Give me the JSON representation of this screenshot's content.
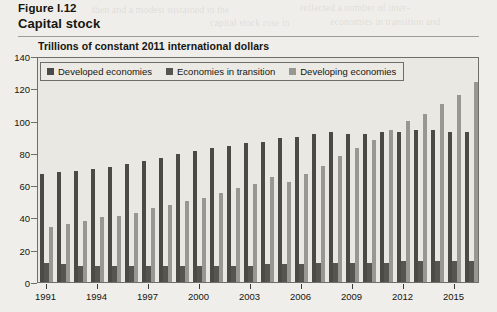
{
  "figure": {
    "caption": "Figure I.12",
    "title": "Capital stock",
    "subtitle": "Trillions of constant 2011 international dollars"
  },
  "legend": {
    "items": [
      {
        "label": "Developed economies",
        "color": "#4b4a47",
        "key": "developed"
      },
      {
        "label": "Economies in transition",
        "color": "#565550",
        "key": "transition"
      },
      {
        "label": "Developing economies",
        "color": "#989792",
        "key": "developing"
      }
    ]
  },
  "chart_data": {
    "type": "bar",
    "title": "Capital stock",
    "subtitle": "Trillions of constant 2011 international dollars",
    "xlabel": "",
    "ylabel": "Trillions of constant 2011 international dollars",
    "ylim": [
      0,
      140
    ],
    "yticks": [
      0,
      20,
      40,
      60,
      80,
      100,
      120,
      140
    ],
    "grid": false,
    "legend_position": "top-left",
    "categories": [
      "1991",
      "1992",
      "1993",
      "1994",
      "1995",
      "1996",
      "1997",
      "1998",
      "1999",
      "2000",
      "2001",
      "2002",
      "2003",
      "2004",
      "2005",
      "2006",
      "2007",
      "2008",
      "2009",
      "2010",
      "2011",
      "2012",
      "2013",
      "2014",
      "2015",
      "2016"
    ],
    "xtick_labels": [
      "1991",
      "1994",
      "1997",
      "2000",
      "2003",
      "2006",
      "2009",
      "2012",
      "2015"
    ],
    "series": [
      {
        "name": "Developed economies",
        "color": "#4b4a47",
        "values": [
          67,
          68,
          69,
          70,
          71,
          73,
          75,
          77,
          79,
          81,
          83,
          84,
          86,
          87,
          89,
          90,
          92,
          93,
          92,
          92,
          93,
          93,
          94,
          94,
          93,
          93
        ]
      },
      {
        "name": "Economies in transition",
        "color": "#565550",
        "values": [
          12,
          11,
          10,
          10,
          10,
          10,
          10,
          10,
          10,
          10,
          10,
          10,
          10,
          11,
          11,
          11,
          12,
          12,
          12,
          12,
          12,
          13,
          13,
          13,
          13,
          13
        ]
      },
      {
        "name": "Developing economies",
        "color": "#989792",
        "values": [
          34,
          36,
          38,
          40,
          41,
          43,
          46,
          48,
          50,
          52,
          55,
          58,
          61,
          65,
          62,
          67,
          72,
          78,
          83,
          88,
          94,
          100,
          104,
          110,
          116,
          124
        ]
      }
    ]
  },
  "bleed_text": [
    {
      "text": "then and a modest sustained in the",
      "x": 92,
      "y": 4,
      "size": 10
    },
    {
      "text": "reflected a number of inter-",
      "x": 300,
      "y": 2,
      "size": 10
    },
    {
      "text": "capital stock rose in",
      "x": 210,
      "y": 17,
      "size": 10
    },
    {
      "text": "economies in transition and",
      "x": 330,
      "y": 16,
      "size": 10
    },
    {
      "text": "growth of output per worker",
      "x": 170,
      "y": 86,
      "size": 10
    },
    {
      "text": "the capital stock, while",
      "x": 200,
      "y": 98,
      "size": 10
    },
    {
      "text": "is illustrated in Figure I.12,",
      "x": 150,
      "y": 108,
      "size": 10
    },
    {
      "text": "growth in the developing",
      "x": 180,
      "y": 120,
      "size": 10
    },
    {
      "text": "rate of capital accumulation",
      "x": 150,
      "y": 132,
      "size": 10
    },
    {
      "text": "the stock of capital",
      "x": 160,
      "y": 144,
      "size": 10
    },
    {
      "text": "to the level in the",
      "x": 120,
      "y": 156,
      "size": 10
    },
    {
      "text": "1990s",
      "x": 100,
      "y": 168,
      "size": 10
    },
    {
      "text": "and the",
      "x": 395,
      "y": 96,
      "size": 10
    },
    {
      "text": "the limits the",
      "x": 360,
      "y": 110,
      "size": 10
    },
    {
      "text": "to such",
      "x": 395,
      "y": 122,
      "size": 10
    },
    {
      "text": "1991",
      "x": 70,
      "y": 226,
      "size": 10
    },
    {
      "text": "1997",
      "x": 180,
      "y": 240,
      "size": 10
    },
    {
      "text": "2003",
      "x": 290,
      "y": 250,
      "size": 10
    },
    {
      "text": "in order to raise",
      "x": 320,
      "y": 84,
      "size": 10
    },
    {
      "text": "that have been drawn",
      "x": 300,
      "y": 96,
      "size": 10
    }
  ]
}
